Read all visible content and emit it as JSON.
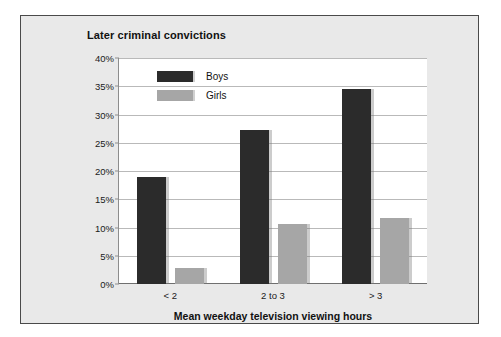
{
  "chart_data": {
    "type": "bar",
    "title": "Later criminal convictions",
    "xlabel": "Mean weekday television viewing hours",
    "ylabel": "",
    "categories": [
      "< 2",
      "2 to 3",
      "> 3"
    ],
    "series": [
      {
        "name": "Boys",
        "color": "#2b2b2b",
        "values": [
          19.0,
          27.3,
          34.6
        ]
      },
      {
        "name": "Girls",
        "color": "#a6a6a6",
        "values": [
          2.8,
          10.7,
          11.7
        ]
      }
    ],
    "ylim": [
      0,
      40
    ],
    "ytick_labels": [
      "0%",
      "5%",
      "10%",
      "15%",
      "20%",
      "25%",
      "30%",
      "35%",
      "40%"
    ],
    "ytick_values": [
      0,
      5,
      10,
      15,
      20,
      25,
      30,
      35,
      40
    ],
    "grid": true,
    "legend_position": "top-left-inside"
  }
}
